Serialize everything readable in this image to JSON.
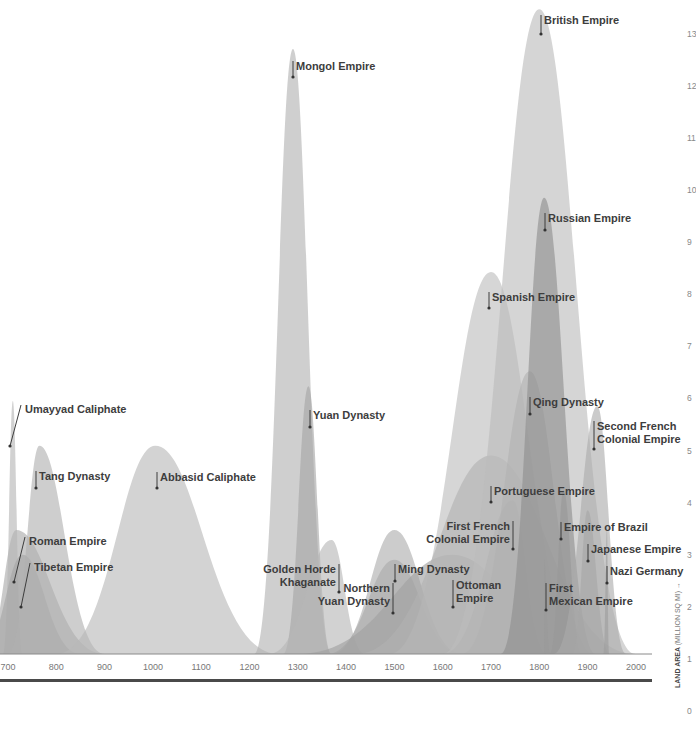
{
  "chart_data": {
    "type": "area",
    "title": "",
    "xlabel": "",
    "ylabel": "LAND AREA",
    "ylabel_unit": "(MILLION SQ MI)",
    "ylabel_arrow": "→",
    "xlim": [
      700,
      2040
    ],
    "ylim": [
      0,
      13.4
    ],
    "grid": false,
    "x_ticks": [
      "700",
      "800",
      "900",
      "1000",
      "1100",
      "1200",
      "1300",
      "1400",
      "1500",
      "1600",
      "1700",
      "1800",
      "1900",
      "2000"
    ],
    "y_ticks": [
      "0",
      "1",
      "2",
      "3",
      "4",
      "5",
      "6",
      "7",
      "8",
      "9",
      "10",
      "11",
      "12",
      "13"
    ],
    "series": [
      {
        "name": "Roman Empire",
        "start": 650,
        "peak_year": 717,
        "peak": 2.5,
        "end": 900,
        "label_lines": [
          "Roman Empire"
        ],
        "color": "#a9a9a9"
      },
      {
        "name": "Umayyad Caliphate",
        "start": 690,
        "peak_year": 710,
        "peak": 5.1,
        "end": 730,
        "label_lines": [
          "Umayyad Caliphate"
        ],
        "color": "#b4b4b4"
      },
      {
        "name": "Tibetan Empire",
        "start": 640,
        "peak_year": 730,
        "peak": 2.0,
        "end": 850,
        "label_lines": [
          "Tibetan Empire"
        ],
        "color": "#a5a5a5"
      },
      {
        "name": "Tang Dynasty",
        "start": 700,
        "peak_year": 765,
        "peak": 4.2,
        "end": 900,
        "label_lines": [
          "Tang Dynasty"
        ],
        "color": "#b0b0b0"
      },
      {
        "name": "Abbasid Caliphate",
        "start": 800,
        "peak_year": 1005,
        "peak": 4.2,
        "end": 1260,
        "label_lines": [
          "Abbasid Caliphate"
        ],
        "color": "#b8b8b8"
      },
      {
        "name": "Mongol Empire",
        "start": 1210,
        "peak_year": 1290,
        "peak": 12.2,
        "end": 1370,
        "label_lines": [
          "Mongol Empire"
        ],
        "color": "#b1b1b1"
      },
      {
        "name": "Yuan Dynasty",
        "start": 1270,
        "peak_year": 1322,
        "peak": 5.4,
        "end": 1370,
        "label_lines": [
          "Yuan Dynasty"
        ],
        "color": "#a4a4a4"
      },
      {
        "name": "Golden Horde Khaganate",
        "start": 1240,
        "peak_year": 1370,
        "peak": 2.3,
        "end": 1440,
        "label_lines": [
          "Golden Horde",
          "Khaganate"
        ],
        "color": "#b6b6b6"
      },
      {
        "name": "Northern Yuan Dynasty",
        "start": 1360,
        "peak_year": 1500,
        "peak": 1.9,
        "end": 1640,
        "label_lines": [
          "Northern",
          "Yuan Dynasty"
        ],
        "color": "#a8a8a8"
      },
      {
        "name": "Ming Dynasty",
        "start": 1370,
        "peak_year": 1500,
        "peak": 2.5,
        "end": 1640,
        "label_lines": [
          "Ming Dynasty"
        ],
        "color": "#acacac"
      },
      {
        "name": "Ottoman Empire",
        "start": 1300,
        "peak_year": 1620,
        "peak": 2.0,
        "end": 1920,
        "label_lines": [
          "Ottoman",
          "Empire"
        ],
        "color": "#9f9f9f"
      },
      {
        "name": "Spanish Empire",
        "start": 1490,
        "peak_year": 1700,
        "peak": 7.7,
        "end": 1900,
        "label_lines": [
          "Spanish Empire"
        ],
        "color": "#bdbdbd"
      },
      {
        "name": "Portuguese Empire",
        "start": 1420,
        "peak_year": 1700,
        "peak": 4.0,
        "end": 1999,
        "label_lines": [
          "Portuguese Empire"
        ],
        "color": "#b2b2b2"
      },
      {
        "name": "First French Colonial Empire",
        "start": 1600,
        "peak_year": 1745,
        "peak": 3.1,
        "end": 1815,
        "label_lines": [
          "First French",
          "Colonial Empire"
        ],
        "color": "#a7a7a7"
      },
      {
        "name": "Qing Dynasty",
        "start": 1640,
        "peak_year": 1780,
        "peak": 5.7,
        "end": 1912,
        "label_lines": [
          "Qing Dynasty"
        ],
        "color": "#a2a2a2"
      },
      {
        "name": "British Empire",
        "start": 1600,
        "peak_year": 1800,
        "peak": 13.0,
        "end": 1999,
        "label_lines": [
          "British Empire"
        ],
        "color": "#bcbcbc"
      },
      {
        "name": "Russian Empire",
        "start": 1720,
        "peak_year": 1810,
        "peak": 9.2,
        "end": 1917,
        "label_lines": [
          "Russian Empire"
        ],
        "color": "#8e8e8e"
      },
      {
        "name": "First Mexican Empire",
        "start": 1810,
        "peak_year": 1810,
        "peak": 1.9,
        "end": 1823,
        "label_lines": [
          "First",
          "Mexican Empire"
        ],
        "color": "#999999"
      },
      {
        "name": "Empire of Brazil",
        "start": 1822,
        "peak_year": 1850,
        "peak": 3.3,
        "end": 1889,
        "label_lines": [
          "Empire of Brazil"
        ],
        "color": "#979797"
      },
      {
        "name": "Second French Colonial Empire",
        "start": 1830,
        "peak_year": 1920,
        "peak": 5.0,
        "end": 1980,
        "label_lines": [
          "Second French",
          "Colonial Empire"
        ],
        "color": "#ababab"
      },
      {
        "name": "Japanese Empire",
        "start": 1868,
        "peak_year": 1900,
        "peak": 2.9,
        "end": 1947,
        "label_lines": [
          "Japanese Empire"
        ],
        "color": "#a6a6a6"
      },
      {
        "name": "Nazi Germany",
        "start": 1933,
        "peak_year": 1940,
        "peak": 2.5,
        "end": 1945,
        "label_lines": [
          "Nazi Germany"
        ],
        "color": "#9d9d9d"
      }
    ]
  },
  "colors": {
    "axis": "#555555",
    "baseline_bar": "#4a4a4a",
    "label_text": "#3d3d3d",
    "tick_text": "#777777"
  }
}
